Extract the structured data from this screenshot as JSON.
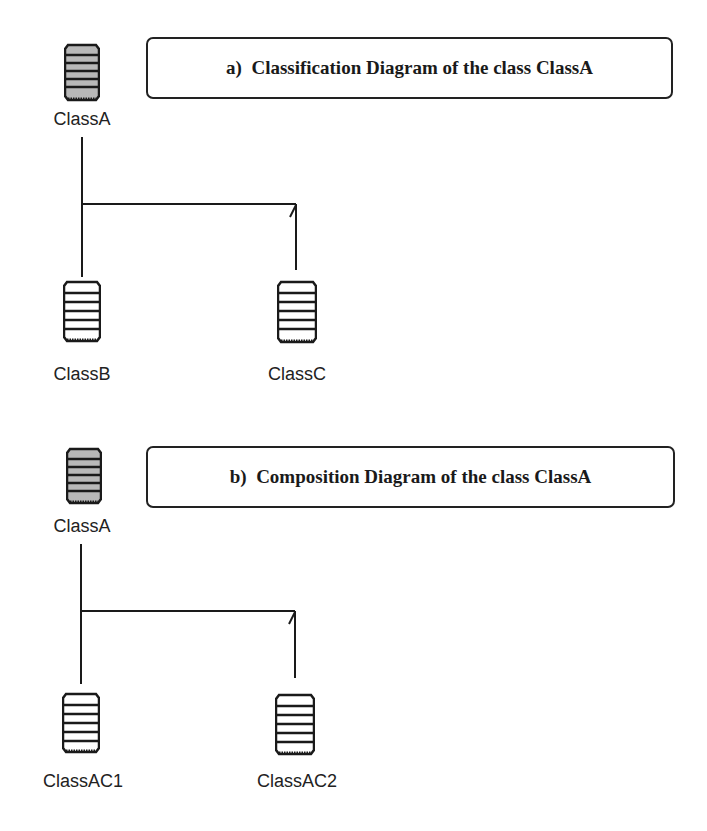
{
  "sections": [
    {
      "id": "a",
      "title": "a)  Classification Diagram of the class ClassA",
      "root": {
        "label": "ClassA",
        "icon": "class-icon-abstract",
        "fill": "#b8b8b8"
      },
      "children": [
        {
          "label": "ClassB",
          "icon": "class-icon",
          "fill": "#ffffff"
        },
        {
          "label": "ClassC",
          "icon": "class-icon",
          "fill": "#ffffff"
        }
      ]
    },
    {
      "id": "b",
      "title": "b)  Composition Diagram of the class ClassA",
      "root": {
        "label": "ClassA",
        "icon": "class-icon-abstract",
        "fill": "#b8b8b8"
      },
      "children": [
        {
          "label": "ClassAC1",
          "icon": "class-icon",
          "fill": "#ffffff"
        },
        {
          "label": "ClassAC2",
          "icon": "class-icon",
          "fill": "#ffffff"
        }
      ]
    }
  ],
  "colors": {
    "line": "#1a1a1a",
    "root_fill": "#b8b8b8",
    "child_fill": "#ffffff"
  }
}
